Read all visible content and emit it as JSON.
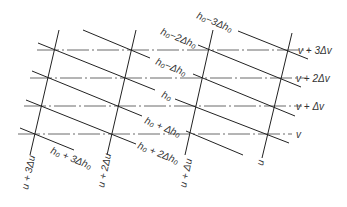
{
  "diagram": {
    "type": "coordinate-net",
    "u_lines": [
      {
        "label": "u + 3Δu",
        "x1": 59,
        "y1": 30,
        "x2": 30,
        "y2": 155,
        "lx": 28,
        "ly": 190
      },
      {
        "label": "u + 2Δu",
        "x1": 136,
        "y1": 30,
        "x2": 107,
        "y2": 155,
        "lx": 104,
        "ly": 188
      },
      {
        "label": "u + Δu",
        "x1": 213,
        "y1": 30,
        "x2": 185,
        "y2": 155,
        "lx": 186,
        "ly": 188
      },
      {
        "label": "u",
        "x1": 292,
        "y1": 33,
        "x2": 262,
        "y2": 158,
        "lx": 263,
        "ly": 166
      }
    ],
    "v_lines": [
      {
        "label": "v + 3Δv",
        "y": 50,
        "x1": 37,
        "x2": 310,
        "lx": 298,
        "ly": 54
      },
      {
        "label": "v + 2Δv",
        "y": 78,
        "x1": 30,
        "x2": 306,
        "lx": 296,
        "ly": 82
      },
      {
        "label": "v + Δv",
        "y": 106,
        "x1": 24,
        "x2": 302,
        "lx": 296,
        "ly": 110
      },
      {
        "label": "v",
        "y": 134,
        "x1": 18,
        "x2": 292,
        "lx": 296,
        "ly": 138
      }
    ],
    "h_lines": [
      {
        "label": "h₀−3Δh₀",
        "segments": [
          [
            238,
            31,
            308,
            59
          ]
        ],
        "lx": 196,
        "ly": 18
      },
      {
        "label": "h₀−2Δh₀",
        "segments": [
          [
            198,
            45,
            301,
            87
          ]
        ],
        "lx": 160,
        "ly": 34
      },
      {
        "label": "h₀−Δh₀",
        "segments": [
          [
            83,
            30,
            150,
            58
          ],
          [
            193,
            74,
            295,
            116
          ]
        ],
        "lx": 155,
        "ly": 64
      },
      {
        "label": "h₀",
        "segments": [
          [
            38,
            43,
            155,
            90
          ],
          [
            175,
            99,
            289,
            143
          ]
        ],
        "lx": 161,
        "ly": 97
      },
      {
        "label": "h₀ + Δh₀",
        "segments": [
          [
            32,
            71,
            142,
            116
          ],
          [
            186,
            131,
            243,
            155
          ]
        ],
        "lx": 144,
        "ly": 123
      },
      {
        "label": "h₀ + 2Δh₀",
        "segments": [
          [
            26,
            100,
            136,
            144
          ]
        ],
        "lx": 137,
        "ly": 148
      },
      {
        "label": "h₀ + 3Δh₀",
        "segments": [
          [
            20,
            128,
            74,
            150
          ]
        ],
        "lx": 50,
        "ly": 153
      }
    ]
  }
}
